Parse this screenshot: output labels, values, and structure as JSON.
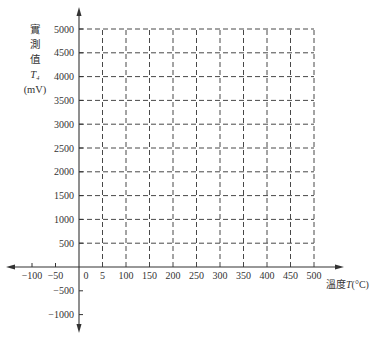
{
  "chart_data": {
    "type": "line",
    "title": "",
    "xlabel": "溫度T(°C)",
    "ylabel": "實測值 T4 (mV)",
    "xlabel_parts": {
      "prefix": "溫度",
      "var": "T",
      "unit": "(°C)"
    },
    "ylabel_lines": [
      "實",
      "測",
      "值",
      "T₄",
      "(mV)"
    ],
    "x_ticks": [
      -100,
      -50,
      0,
      50,
      100,
      150,
      200,
      250,
      300,
      350,
      400,
      450,
      500
    ],
    "x_tick_labels": [
      "−100",
      "−50",
      "0",
      "5",
      "100",
      "150",
      "200",
      "250",
      "300",
      "350",
      "400",
      "450",
      "500"
    ],
    "y_ticks": [
      -1000,
      -500,
      500,
      1000,
      1500,
      2000,
      2500,
      3000,
      3500,
      4000,
      4500,
      5000
    ],
    "y_tick_labels": [
      "−1000",
      "−500",
      "500",
      "1000",
      "1500",
      "2000",
      "2500",
      "3000",
      "3500",
      "4000",
      "4500",
      "5000"
    ],
    "xlim": [
      -100,
      500
    ],
    "ylim": [
      -1000,
      5000
    ],
    "grid": {
      "enabled": true,
      "style": "dashed",
      "x_range": [
        0,
        500
      ],
      "y_range": [
        0,
        5000
      ],
      "x_step": 50,
      "y_step": 500
    },
    "series": [],
    "legend": null
  }
}
